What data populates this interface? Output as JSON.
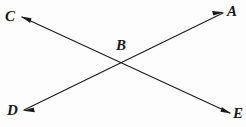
{
  "figure": {
    "background_color": "#fdfdfd",
    "stroke_color": "#1a1a1a",
    "stroke_width": 1.1,
    "labels": {
      "A": "A",
      "B": "B",
      "C": "C",
      "D": "D",
      "E": "E"
    },
    "points": {
      "A": {
        "x": 223,
        "y": 13
      },
      "B": {
        "x": 122,
        "y": 62
      },
      "C": {
        "x": 22,
        "y": 17
      },
      "D": {
        "x": 24,
        "y": 110
      },
      "E": {
        "x": 230,
        "y": 113
      }
    },
    "lines": [
      {
        "name": "line-CE",
        "from": "C",
        "to": "E",
        "arrowheads": [
          "C",
          "E"
        ],
        "path": "M 22 17 L 230 113"
      },
      {
        "name": "line-DA",
        "from": "D",
        "to": "A",
        "arrowheads": [
          "D",
          "A"
        ],
        "path": "M 24 110 L 223 13"
      }
    ],
    "intersection_label": "B"
  }
}
